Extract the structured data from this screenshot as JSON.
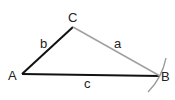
{
  "diagram": {
    "type": "triangle-construction",
    "vertices": {
      "A": {
        "label": "A",
        "x": 22,
        "y": 74
      },
      "B": {
        "label": "B",
        "x": 160,
        "y": 76
      },
      "C": {
        "label": "C",
        "x": 73,
        "y": 27
      }
    },
    "sides": {
      "a": {
        "label": "a",
        "from": "C",
        "to": "B",
        "color": "#a0a0a0"
      },
      "b": {
        "label": "b",
        "from": "A",
        "to": "C",
        "color": "#111111"
      },
      "c": {
        "label": "c",
        "from": "A",
        "to": "B",
        "color": "#111111"
      }
    },
    "arc": {
      "near": "B",
      "color": "#9a9a9a"
    }
  }
}
